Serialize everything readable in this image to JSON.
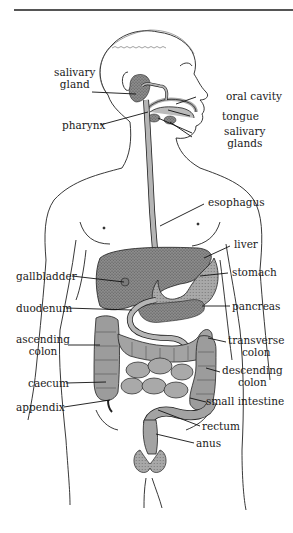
{
  "figure": {
    "colors": {
      "line": "#222222",
      "organ_fill": "#9a9a9a",
      "organ_dark": "#6f6f6f",
      "tract_fill": "#b5b5b5",
      "background": "#ffffff"
    },
    "labels": {
      "salivary_gland": [
        "salivary",
        "gland"
      ],
      "oral_cavity": "oral cavity",
      "tongue": "tongue",
      "pharynx": "pharynx",
      "salivary_glands": [
        "salivary",
        "glands"
      ],
      "esophagus": "esophagus",
      "liver": "liver",
      "gallbladder": "gallbladder",
      "stomach": "stomach",
      "duodenum": "duodenum",
      "pancreas": "pancreas",
      "ascending_colon": [
        "ascending",
        "colon"
      ],
      "transverse_colon": [
        "transverse",
        "colon"
      ],
      "descending_colon": [
        "descending",
        "colon"
      ],
      "caecum": "caecum",
      "small_intestine": "small intestine",
      "appendix": "appendix",
      "rectum": "rectum",
      "anus": "anus"
    }
  }
}
